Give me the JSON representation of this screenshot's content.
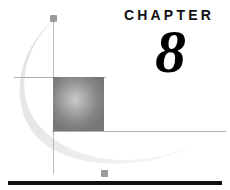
{
  "page": {
    "kind": "book-chapter-opener",
    "background_color": "#ffffff"
  },
  "heading": {
    "label": "CHAPTER",
    "number": "8",
    "label_color": "#111111",
    "number_color": "#000000"
  },
  "decorations": {
    "gradient_square": {
      "name": "gradient-square",
      "center_color": "#c9c9c9",
      "edge_color": "#767676",
      "x": 53,
      "y": 77,
      "width": 51,
      "height": 54
    },
    "crosshair": {
      "line_color": "#b0b0b0",
      "dot_color": "#9a9a9a",
      "vertical_line_x": 53,
      "upper_horizontal_y": 77,
      "lower_horizontal_y": 131
    },
    "arc": {
      "name": "crescent-arc",
      "color": "#ededed"
    },
    "bottom_rule": {
      "color": "#111111",
      "x": 8,
      "y": 181,
      "width": 214,
      "height": 4
    }
  }
}
